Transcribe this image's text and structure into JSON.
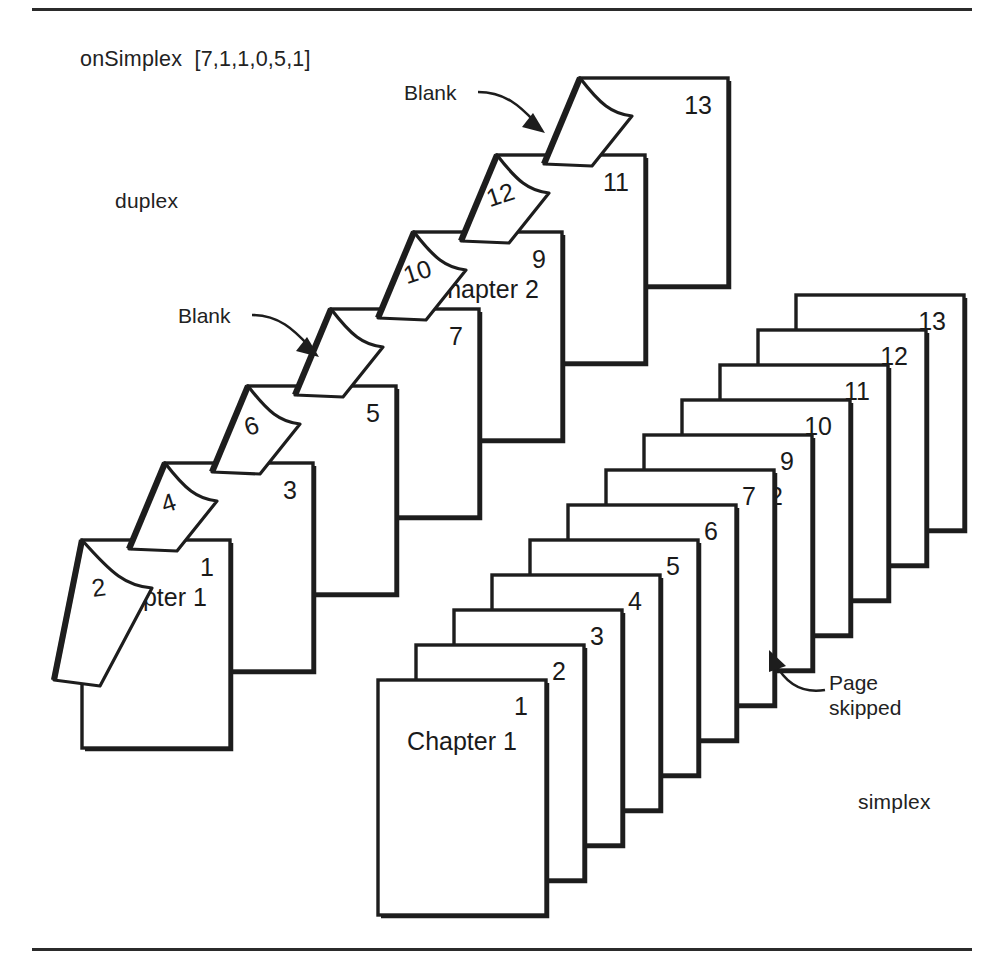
{
  "figure": {
    "title": "onSimplex  [7,1,1,0,5,1]",
    "duplex_label": "duplex",
    "simplex_label": "simplex"
  },
  "annotations": {
    "blank_top": "Blank",
    "blank_mid": "Blank",
    "page_skipped_line1": "Page",
    "page_skipped_line2": "skipped"
  },
  "colors": {
    "ink": "#1d1d1d",
    "paper": "#ffffff",
    "rule": "#2b2b2b"
  },
  "duplex_stack": {
    "label": "duplex",
    "description": "Stack of duplex sheets, each printed front and back; folded corner reveals the verso page number.",
    "sheets": [
      {
        "recto": "1",
        "verso": "2",
        "chapter": "Chapter 1",
        "verso_blank": false
      },
      {
        "recto": "3",
        "verso": "4",
        "chapter": "",
        "verso_blank": false
      },
      {
        "recto": "5",
        "verso": "6",
        "chapter": "",
        "verso_blank": false
      },
      {
        "recto": "7",
        "verso": "",
        "chapter": "",
        "verso_blank": true
      },
      {
        "recto": "9",
        "verso": "10",
        "chapter": "Chapter 2",
        "verso_blank": false
      },
      {
        "recto": "11",
        "verso": "12",
        "chapter": "",
        "verso_blank": false
      },
      {
        "recto": "13",
        "verso": "",
        "chapter": "",
        "verso_blank": true
      }
    ]
  },
  "simplex_stack": {
    "label": "simplex",
    "description": "Stack of simplex sheets, one page per sheet; page 8 is skipped so Chapter 2 starts on a fresh sheet.",
    "sheets": [
      {
        "page": "1",
        "chapter": "Chapter 1"
      },
      {
        "page": "2",
        "chapter": ""
      },
      {
        "page": "3",
        "chapter": ""
      },
      {
        "page": "4",
        "chapter": ""
      },
      {
        "page": "5",
        "chapter": ""
      },
      {
        "page": "6",
        "chapter": ""
      },
      {
        "page": "7",
        "chapter": ""
      },
      {
        "page": "9",
        "chapter": "Chapter 2"
      },
      {
        "page": "10",
        "chapter": ""
      },
      {
        "page": "11",
        "chapter": ""
      },
      {
        "page": "12",
        "chapter": ""
      },
      {
        "page": "13",
        "chapter": ""
      }
    ],
    "skipped_page": "8"
  }
}
